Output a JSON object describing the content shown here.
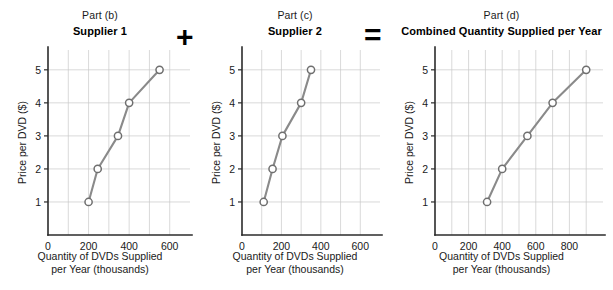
{
  "operators": {
    "plus": "+",
    "equals": "="
  },
  "axis_caption_line1": "Quantity of DVDs Supplied",
  "axis_caption_line2": "per Year (thousands)",
  "ylabel": "Price per DVD ($)",
  "panels": [
    {
      "part": "Part (b)",
      "title": "Supplier 1"
    },
    {
      "part": "Part (c)",
      "title": "Supplier 2"
    },
    {
      "part": "Part (d)",
      "title": "Combined Quantity Supplied per Year"
    }
  ],
  "chart_data": [
    {
      "type": "line",
      "title": "Supplier 1",
      "subtitle": "Part (b)",
      "xlabel": "Quantity of DVDs Supplied per Year (thousands)",
      "ylabel": "Price per DVD ($)",
      "x": [
        200,
        245,
        345,
        400,
        550
      ],
      "y": [
        1,
        2,
        3,
        4,
        5
      ],
      "xlim": [
        0,
        700
      ],
      "ylim": [
        0,
        5.6
      ],
      "xticks": [
        0,
        200,
        400,
        600
      ],
      "xtick_labels": [
        "0",
        "200",
        "400",
        "600"
      ],
      "yticks": [
        1,
        2,
        3,
        4,
        5
      ],
      "ytick_labels": [
        "1",
        "2",
        "3",
        "4",
        "5"
      ],
      "grid_x_every": 100,
      "grid": true,
      "legend": "none",
      "marker": "open-circle",
      "line_color": "#8a8a8a",
      "marker_face": "#ffffff",
      "marker_edge": "#6f6f6f"
    },
    {
      "type": "line",
      "title": "Supplier 2",
      "subtitle": "Part (c)",
      "xlabel": "Quantity of DVDs Supplied per Year (thousands)",
      "ylabel": "Price per DVD ($)",
      "x": [
        110,
        155,
        205,
        300,
        350
      ],
      "y": [
        1,
        2,
        3,
        4,
        5
      ],
      "xlim": [
        0,
        700
      ],
      "ylim": [
        0,
        5.6
      ],
      "xticks": [
        0,
        200,
        400,
        600
      ],
      "xtick_labels": [
        "0",
        "200",
        "400",
        "600"
      ],
      "yticks": [
        1,
        2,
        3,
        4,
        5
      ],
      "ytick_labels": [
        "1",
        "2",
        "3",
        "4",
        "5"
      ],
      "grid_x_every": 100,
      "grid": true,
      "legend": "none",
      "marker": "open-circle",
      "line_color": "#8a8a8a",
      "marker_face": "#ffffff",
      "marker_edge": "#6f6f6f"
    },
    {
      "type": "line",
      "title": "Combined Quantity Supplied per Year",
      "subtitle": "Part (d)",
      "xlabel": "Quantity of DVDs Supplied per Year (thousands)",
      "ylabel": "Price per DVD ($)",
      "x": [
        310,
        400,
        550,
        700,
        900
      ],
      "y": [
        1,
        2,
        3,
        4,
        5
      ],
      "xlim": [
        0,
        1000
      ],
      "ylim": [
        0,
        5.6
      ],
      "xticks": [
        0,
        200,
        400,
        600,
        800
      ],
      "xtick_labels": [
        "0",
        "200",
        "400",
        "600",
        "800"
      ],
      "yticks": [
        1,
        2,
        3,
        4,
        5
      ],
      "ytick_labels": [
        "1",
        "2",
        "3",
        "4",
        "5"
      ],
      "grid_x_every": 100,
      "grid": true,
      "legend": "none",
      "marker": "open-circle",
      "line_color": "#8a8a8a",
      "marker_face": "#ffffff",
      "marker_edge": "#6f6f6f"
    }
  ]
}
